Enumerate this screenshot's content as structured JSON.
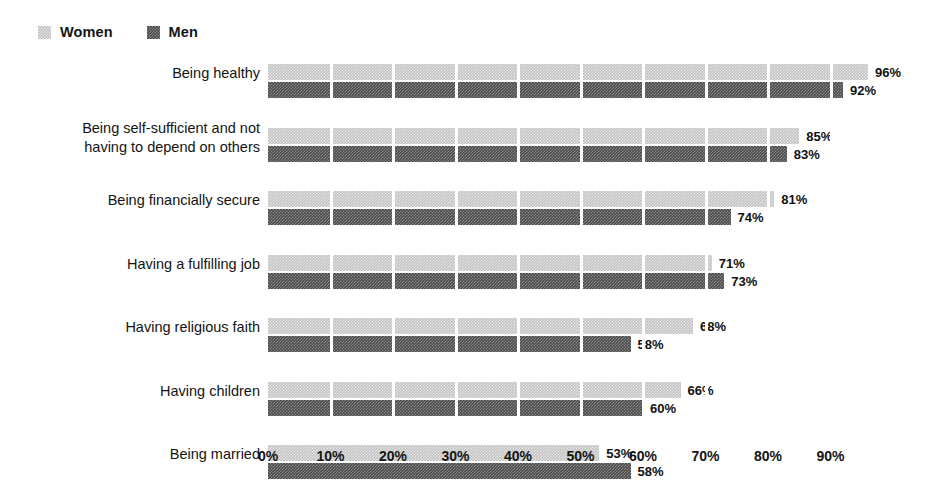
{
  "legend": {
    "entries": [
      {
        "label": "Women",
        "color": "#c3c3c3",
        "icon": "legend-swatch-icon"
      },
      {
        "label": "Men",
        "color": "#4b4b4b",
        "icon": "legend-swatch-icon"
      }
    ]
  },
  "axis": {
    "ticks": [
      "0%",
      "10%",
      "20%",
      "30%",
      "40%",
      "50%",
      "60%",
      "70%",
      "80%",
      "90%"
    ]
  },
  "chart_data": {
    "type": "bar",
    "orientation": "horizontal",
    "title": "",
    "subtitle": "",
    "xlabel": "",
    "ylabel": "",
    "xlim": [
      0,
      96
    ],
    "x_tick_values": [
      0,
      10,
      20,
      30,
      40,
      50,
      60,
      70,
      80,
      90
    ],
    "x_tick_labels": [
      "0%",
      "10%",
      "20%",
      "30%",
      "40%",
      "50%",
      "60%",
      "70%",
      "80%",
      "90%"
    ],
    "grid": "vertical-white-separators",
    "legend_position": "top-left",
    "value_label_suffix": "%",
    "categories": [
      "Being healthy",
      "Being self-sufficient and not\nhaving to depend on others",
      "Being financially secure",
      "Having a fulfilling job",
      "Having religious faith",
      "Having children",
      "Being married"
    ],
    "series": [
      {
        "name": "Women",
        "color": "#c3c3c3",
        "values": [
          96,
          85,
          81,
          71,
          68,
          66,
          53
        ],
        "value_labels": [
          "96%",
          "85%",
          "81%",
          "71%",
          "68%",
          "66%",
          "53%"
        ]
      },
      {
        "name": "Men",
        "color": "#4b4b4b",
        "values": [
          92,
          83,
          74,
          73,
          58,
          60,
          58
        ],
        "value_labels": [
          "92%",
          "83%",
          "74%",
          "73%",
          "58%",
          "60%",
          "58%"
        ]
      }
    ]
  }
}
